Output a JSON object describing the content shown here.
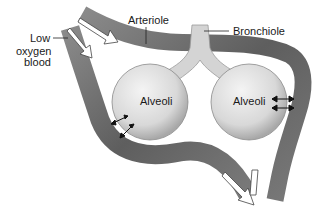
{
  "diagram": {
    "labels": {
      "low_oxygen_line1": "Low",
      "low_oxygen_line2": "oxygen",
      "low_oxygen_line3": "blood",
      "arteriole": "Arteriole",
      "bronchiole": "Bronchiole",
      "alveoli_left": "Alveoli",
      "alveoli_right": "Alveoli"
    },
    "colors": {
      "vessel": "#6e6e6e",
      "vessel_highlight": "#9a9a9a",
      "alveolus": "#dcdcdc",
      "bronchiole": "#d4d4d4",
      "arrow": "#ffffff",
      "text": "#1a1a1a"
    }
  }
}
